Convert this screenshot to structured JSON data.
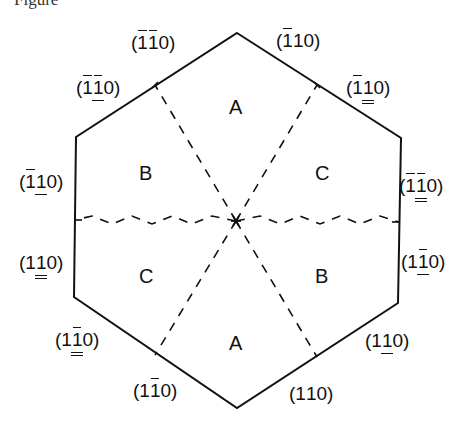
{
  "caption": "Figure",
  "hexagon": {
    "vertices": [
      [
        237,
        33
      ],
      [
        401,
        138
      ],
      [
        398,
        303
      ],
      [
        237,
        408
      ],
      [
        74,
        297
      ],
      [
        76,
        137
      ]
    ],
    "center": [
      236,
      221
    ],
    "stroke": "#111111"
  },
  "dashed_lines": [
    {
      "from": [
        236,
        221
      ],
      "to": [
        155,
        85
      ]
    },
    {
      "from": [
        236,
        221
      ],
      "to": [
        317,
        85
      ]
    },
    {
      "from": [
        236,
        221
      ],
      "to": [
        399,
        222
      ]
    },
    {
      "from": [
        236,
        221
      ],
      "to": [
        317,
        357
      ]
    },
    {
      "from": [
        236,
        221
      ],
      "to": [
        155,
        355
      ]
    },
    {
      "from": [
        236,
        221
      ],
      "to": [
        75,
        220
      ]
    }
  ],
  "regions": [
    {
      "id": "top",
      "label": "A"
    },
    {
      "id": "upper-left",
      "label": "B"
    },
    {
      "id": "upper-right",
      "label": "C"
    },
    {
      "id": "lower-left",
      "label": "C"
    },
    {
      "id": "lower-right",
      "label": "B"
    },
    {
      "id": "bottom",
      "label": "A"
    }
  ],
  "face_labels": [
    {
      "id": "top-left-upper",
      "text": "(īī0)",
      "digits": [
        "1",
        "1",
        "0"
      ],
      "bars": [
        true,
        true,
        false
      ],
      "underline": [
        0,
        0,
        0
      ]
    },
    {
      "id": "top-right-upper",
      "text": "(ī10)",
      "digits": [
        "1",
        "1",
        "0"
      ],
      "bars": [
        true,
        false,
        false
      ],
      "underline": [
        0,
        0,
        0
      ]
    },
    {
      "id": "top-left-lower",
      "text": "(īī0)",
      "digits": [
        "1",
        "1",
        "0"
      ],
      "bars": [
        true,
        true,
        false
      ],
      "underline": [
        0,
        1,
        0
      ]
    },
    {
      "id": "top-right-lower",
      "text": "(ī10)",
      "digits": [
        "1",
        "1",
        "0"
      ],
      "bars": [
        true,
        false,
        false
      ],
      "underline": [
        0,
        2,
        0
      ]
    },
    {
      "id": "left-upper",
      "text": "(ī10)",
      "digits": [
        "1",
        "1",
        "0"
      ],
      "bars": [
        true,
        false,
        false
      ],
      "underline": [
        0,
        1,
        0
      ]
    },
    {
      "id": "right-upper",
      "text": "(īī0)",
      "digits": [
        "1",
        "1",
        "0"
      ],
      "bars": [
        true,
        true,
        false
      ],
      "underline": [
        0,
        2,
        0
      ]
    },
    {
      "id": "left-lower",
      "text": "(110)",
      "digits": [
        "1",
        "1",
        "0"
      ],
      "bars": [
        false,
        false,
        false
      ],
      "underline": [
        0,
        2,
        0
      ]
    },
    {
      "id": "right-lower",
      "text": "(1ī0)",
      "digits": [
        "1",
        "1",
        "0"
      ],
      "bars": [
        false,
        true,
        false
      ],
      "underline": [
        0,
        1,
        0
      ]
    },
    {
      "id": "bottom-left-upper",
      "text": "(1ī0)",
      "digits": [
        "1",
        "1",
        "0"
      ],
      "bars": [
        false,
        true,
        false
      ],
      "underline": [
        0,
        2,
        0
      ]
    },
    {
      "id": "bottom-right-upper",
      "text": "(110)",
      "digits": [
        "1",
        "1",
        "0"
      ],
      "bars": [
        false,
        false,
        false
      ],
      "underline": [
        0,
        1,
        0
      ]
    },
    {
      "id": "bottom-left-lower",
      "text": "(1ī0)",
      "digits": [
        "1",
        "1",
        "0"
      ],
      "bars": [
        false,
        true,
        false
      ],
      "underline": [
        0,
        0,
        0
      ]
    },
    {
      "id": "bottom-right-lower",
      "text": "(110)",
      "digits": [
        "1",
        "1",
        "0"
      ],
      "bars": [
        false,
        false,
        false
      ],
      "underline": [
        0,
        0,
        0
      ]
    }
  ]
}
